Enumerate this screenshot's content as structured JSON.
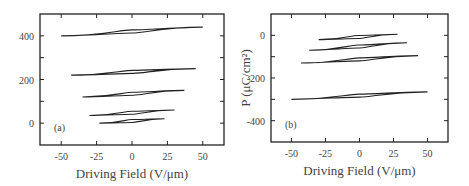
{
  "chart_data": [
    {
      "type": "line",
      "panel_label": "(a)",
      "title": "",
      "xlabel": "Driving Field (V/μm)",
      "ylabel": "",
      "xlim": [
        -65,
        65
      ],
      "ylim": [
        -100,
        500
      ],
      "xticks": [
        -50,
        -25,
        0,
        25,
        50
      ],
      "xtick_labels": [
        "-50",
        "-25",
        "0",
        "25",
        "50"
      ],
      "yticks": [
        0,
        200,
        400
      ],
      "ytick_labels": [
        "0",
        "200",
        "400"
      ],
      "grid": false,
      "series": [
        {
          "name": "loop-1",
          "x_range": [
            -50,
            50
          ],
          "y_range": [
            400,
            440
          ]
        },
        {
          "name": "loop-2",
          "x_range": [
            -43,
            45
          ],
          "y_range": [
            220,
            250
          ]
        },
        {
          "name": "loop-3",
          "x_range": [
            -35,
            37
          ],
          "y_range": [
            120,
            150
          ]
        },
        {
          "name": "loop-4",
          "x_range": [
            -30,
            30
          ],
          "y_range": [
            35,
            60
          ]
        },
        {
          "name": "loop-5",
          "x_range": [
            -23,
            23
          ],
          "y_range": [
            0,
            20
          ]
        }
      ]
    },
    {
      "type": "line",
      "panel_label": "(b)",
      "title": "",
      "xlabel": "Driving Field (V/μm)",
      "ylabel": "P (μC/cm²)",
      "xlim": [
        -65,
        65
      ],
      "ylim": [
        -500,
        100
      ],
      "xticks": [
        -50,
        -25,
        0,
        25,
        50
      ],
      "xtick_labels": [
        "-50",
        "-25",
        "0",
        "25",
        "50"
      ],
      "yticks": [
        0,
        -200,
        -400
      ],
      "ytick_labels": [
        "0",
        "-200",
        "-400"
      ],
      "grid": false,
      "series": [
        {
          "name": "loop-1",
          "x_range": [
            -30,
            28
          ],
          "y_range": [
            -20,
            5
          ]
        },
        {
          "name": "loop-2",
          "x_range": [
            -37,
            35
          ],
          "y_range": [
            -70,
            -35
          ]
        },
        {
          "name": "loop-3",
          "x_range": [
            -43,
            43
          ],
          "y_range": [
            -130,
            -95
          ]
        },
        {
          "name": "loop-4",
          "x_range": [
            -50,
            50
          ],
          "y_range": [
            -300,
            -265
          ]
        }
      ]
    }
  ]
}
